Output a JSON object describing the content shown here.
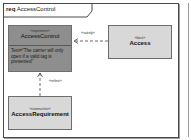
{
  "diagram": {
    "kind": "req",
    "name": "AccessControl"
  },
  "blocks": {
    "access_control": {
      "stereotype": "«requirement»",
      "name": "AccessControl",
      "text": "Text=\"The carrier will only open if a valid tag is presented\"",
      "fill": "#8e8e8e"
    },
    "access": {
      "stereotype": "«block»",
      "name": "Access",
      "fill": "#d8d8d8"
    },
    "access_requirement": {
      "stereotype": "«statemachine»",
      "name": "AccessRequirement",
      "fill": "#d8d8d8"
    }
  },
  "relations": {
    "satisfy": {
      "label": "«satisfy»",
      "from": "Access",
      "to": "AccessControl"
    },
    "refine": {
      "label": "«refine»",
      "from": "AccessRequirement",
      "to": "AccessControl"
    }
  }
}
